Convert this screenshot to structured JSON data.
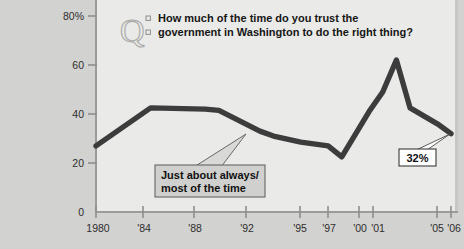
{
  "chart_data": {
    "type": "line",
    "title": "",
    "question": {
      "line1": "How much of the time do you trust the",
      "line2": "government in Washington to do the right thing?",
      "icon": "quote-q-icon"
    },
    "xlabel": "",
    "ylabel": "",
    "ylim": [
      0,
      80
    ],
    "yticks": [
      0,
      20,
      40,
      60,
      80
    ],
    "ytick_labels": [
      "0",
      "20",
      "40",
      "60",
      "80%"
    ],
    "grid": false,
    "legend": false,
    "xtick_labels": [
      "1980",
      "'84",
      "'88",
      "'92",
      "'95",
      "'97",
      "'00",
      "'01",
      "'05",
      "'06"
    ],
    "x": [
      1980,
      1984,
      1988,
      1989,
      1992,
      1993,
      1995,
      1997,
      1998,
      2000,
      2001,
      2002,
      2003,
      2005,
      2006
    ],
    "series": [
      {
        "name": "Just about always/most of the time",
        "values": [
          27,
          42.5,
          42,
          41.5,
          33,
          31,
          28.5,
          27,
          22.5,
          41,
          49,
          62,
          42.5,
          36,
          32
        ],
        "color": "#3c3c3c"
      }
    ],
    "annotations": [
      {
        "name": "series-callout",
        "line1": "Just about always/",
        "line2": "most of the time",
        "points_to_x": 1992,
        "points_to_y": 33
      },
      {
        "name": "endpoint-value",
        "label": "32%",
        "points_to_x": 2006,
        "points_to_y": 32
      }
    ],
    "colors": {
      "line": "#3c3c3c",
      "plot_background": "#eaeae8",
      "outer_background": "#d4d4d2",
      "axis": "#9b9b99",
      "text": "#2e2e2e",
      "callout_fill": "#d0d0ce",
      "value_box_fill": "#ffffff"
    }
  }
}
